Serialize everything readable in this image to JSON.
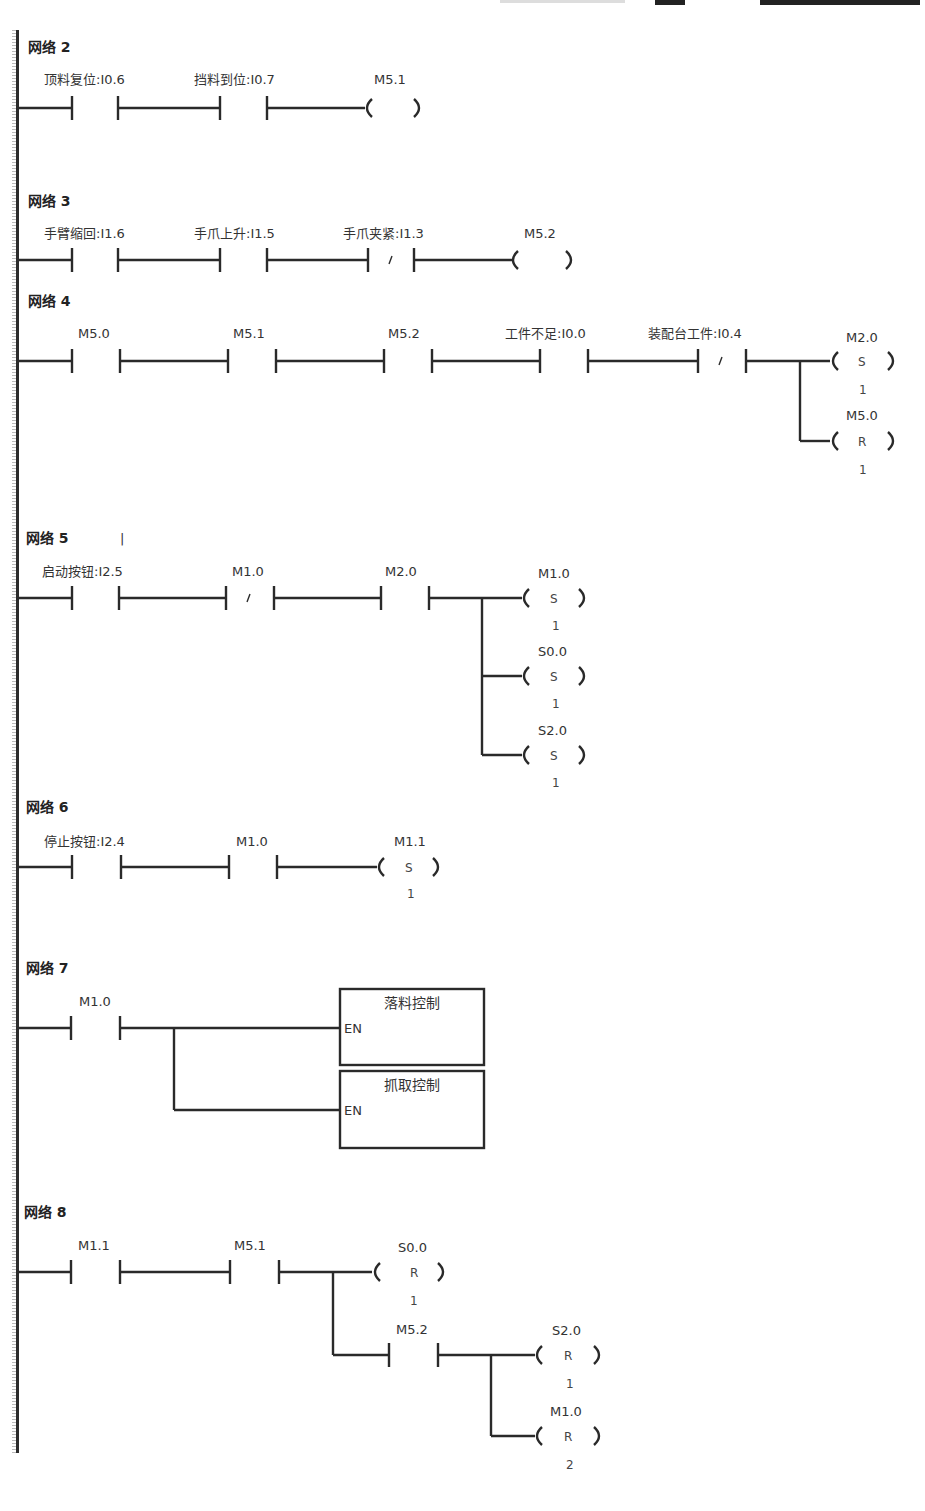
{
  "page": {
    "type": "PLC ladder diagram (STEP 7-Micro/WIN style)"
  },
  "networks": [
    {
      "title": "网络 2",
      "contacts": [
        {
          "label": "顶料复位:I0.6",
          "type": "NO"
        },
        {
          "label": "挡料到位:I0.7",
          "type": "NO"
        }
      ],
      "coils": [
        {
          "label": "M5.1",
          "type": "",
          "n": ""
        }
      ]
    },
    {
      "title": "网络 3",
      "contacts": [
        {
          "label": "手臂缩回:I1.6",
          "type": "NO"
        },
        {
          "label": "手爪上升:I1.5",
          "type": "NO"
        },
        {
          "label": "手爪夹紧:I1.3",
          "type": "NC"
        }
      ],
      "coils": [
        {
          "label": "M5.2",
          "type": "",
          "n": ""
        }
      ]
    },
    {
      "title": "网络 4",
      "contacts": [
        {
          "label": "M5.0",
          "type": "NO"
        },
        {
          "label": "M5.1",
          "type": "NO"
        },
        {
          "label": "M5.2",
          "type": "NO"
        },
        {
          "label": "工件不足:I0.0",
          "type": "NO"
        },
        {
          "label": "装配台工件:I0.4",
          "type": "NC"
        }
      ],
      "coils": [
        {
          "label": "M2.0",
          "type": "S",
          "n": "1"
        },
        {
          "label": "M5.0",
          "type": "R",
          "n": "1"
        }
      ]
    },
    {
      "title": "网络 5",
      "cursor": "|",
      "contacts": [
        {
          "label": "启动按钮:I2.5",
          "type": "NO"
        },
        {
          "label": "M1.0",
          "type": "NC"
        },
        {
          "label": "M2.0",
          "type": "NO"
        }
      ],
      "coils": [
        {
          "label": "M1.0",
          "type": "S",
          "n": "1"
        },
        {
          "label": "S0.0",
          "type": "S",
          "n": "1"
        },
        {
          "label": "S2.0",
          "type": "S",
          "n": "1"
        }
      ]
    },
    {
      "title": "网络 6",
      "contacts": [
        {
          "label": "停止按钮:I2.4",
          "type": "NO"
        },
        {
          "label": "M1.0",
          "type": "NO"
        }
      ],
      "coils": [
        {
          "label": "M1.1",
          "type": "S",
          "n": "1"
        }
      ]
    },
    {
      "title": "网络 7",
      "contacts": [
        {
          "label": "M1.0",
          "type": "NO"
        }
      ],
      "boxes": [
        {
          "title": "落料控制",
          "pin": "EN"
        },
        {
          "title": "抓取控制",
          "pin": "EN"
        }
      ]
    },
    {
      "title": "网络 8",
      "contacts": [
        {
          "label": "M1.1",
          "type": "NO"
        },
        {
          "label": "M5.1",
          "type": "NO"
        },
        {
          "label": "M5.2",
          "type": "NO"
        }
      ],
      "coils": [
        {
          "label": "S0.0",
          "type": "R",
          "n": "1"
        },
        {
          "label": "S2.0",
          "type": "R",
          "n": "1"
        },
        {
          "label": "M1.0",
          "type": "R",
          "n": "2"
        }
      ]
    }
  ]
}
